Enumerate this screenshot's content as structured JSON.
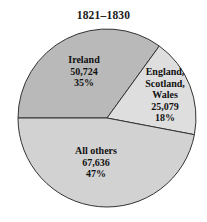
{
  "chart_data": {
    "type": "pie",
    "title": "1821–1830",
    "subtitle": "",
    "xlabel": "",
    "ylabel": "",
    "legend_position": "none",
    "grid": false,
    "total": 143439,
    "categories": [
      "Ireland",
      "England, Scotland, Wales",
      "All others"
    ],
    "values": [
      50724,
      25079,
      67636
    ],
    "percents": [
      35,
      18,
      47
    ],
    "value_labels": [
      "50,724",
      "25,079",
      "67,636"
    ],
    "percent_labels": [
      "35%",
      "18%",
      "47%"
    ],
    "colors": [
      "#b9b9b9",
      "#dedede",
      "#d2d2d2"
    ],
    "slices": [
      {
        "name": "Ireland",
        "name_lines": [
          "Ireland"
        ],
        "value": 50724,
        "value_label": "50,724",
        "percent": 35,
        "percent_label": "35%",
        "color": "#b9b9b9",
        "start_angle_deg": 180,
        "end_angle_deg": 306
      },
      {
        "name": "England, Scotland, Wales",
        "name_lines": [
          "England,",
          "Scotland,",
          "Wales"
        ],
        "value": 25079,
        "value_label": "25,079",
        "percent": 18,
        "percent_label": "18%",
        "color": "#dedede",
        "start_angle_deg": 306,
        "end_angle_deg": 370.8
      },
      {
        "name": "All others",
        "name_lines": [
          "All others"
        ],
        "value": 67636,
        "value_label": "67,636",
        "percent": 47,
        "percent_label": "47%",
        "color": "#d2d2d2",
        "start_angle_deg": 370.8,
        "end_angle_deg": 540
      }
    ],
    "geometry": {
      "center_x": 107,
      "center_y": 118,
      "radius": 89,
      "stroke_color": "#333333"
    }
  },
  "labels": {
    "ireland": {
      "name": "Ireland",
      "value": "50,724",
      "percent": "35%"
    },
    "esw": {
      "line1": "England,",
      "line2": "Scotland,",
      "line3": "Wales",
      "value": "25,079",
      "percent": "18%"
    },
    "others": {
      "name": "All others",
      "value": "67,636",
      "percent": "47%"
    }
  }
}
